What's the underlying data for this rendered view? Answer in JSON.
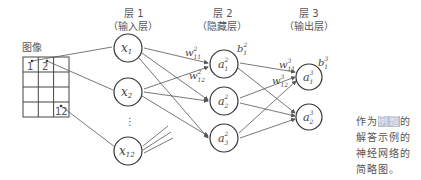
{
  "image_grid": {
    "title": "图像",
    "cells": [
      "1",
      "2",
      "12"
    ]
  },
  "layers": [
    {
      "title": "层 1",
      "subtitle": "（输入层）"
    },
    {
      "title": "层 2",
      "subtitle": "（隐藏层）"
    },
    {
      "title": "层 3",
      "subtitle": "（输出层）"
    }
  ],
  "input_nodes": [
    {
      "base": "x",
      "sub": "1"
    },
    {
      "base": "x",
      "sub": "2"
    },
    {
      "base": "x",
      "sub": "12"
    }
  ],
  "ellipsis": "⋮",
  "hidden_nodes": [
    {
      "base": "a",
      "sub": "1",
      "sup": "2"
    },
    {
      "base": "a",
      "sub": "2",
      "sup": "2"
    },
    {
      "base": "a",
      "sub": "3",
      "sup": "2"
    }
  ],
  "output_nodes": [
    {
      "base": "a",
      "sub": "1",
      "sup": "3"
    },
    {
      "base": "a",
      "sub": "2",
      "sup": "3"
    }
  ],
  "weights": [
    {
      "base": "w",
      "sub": "11",
      "sup": "2"
    },
    {
      "base": "w",
      "sub": "12",
      "sup": "2"
    },
    {
      "base": "w",
      "sub": "11",
      "sup": "3"
    },
    {
      "base": "w",
      "sub": "12",
      "sup": "3"
    }
  ],
  "biases": [
    {
      "base": "b",
      "sub": "1",
      "sup": "2"
    },
    {
      "base": "b",
      "sub": "1",
      "sup": "3"
    }
  ],
  "caption": {
    "prefix": "作为",
    "highlight": "例题",
    "suffix": "的解答示例的神经网络的简略图。"
  }
}
